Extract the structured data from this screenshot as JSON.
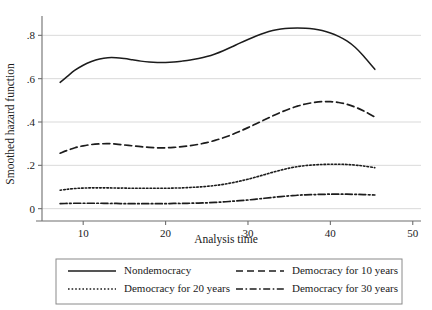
{
  "chart_data": {
    "type": "line",
    "title": "",
    "xlabel": "Analysis time",
    "ylabel": "Smoothed hazard function",
    "xlim": [
      5,
      51
    ],
    "ylim": [
      -0.02,
      0.88
    ],
    "xticks": [
      "10",
      "20",
      "30",
      "40",
      "50"
    ],
    "xtick_values": [
      10,
      20,
      30,
      40,
      50
    ],
    "yticks": [
      "0",
      ".2",
      ".4",
      ".6",
      ".8"
    ],
    "ytick_values": [
      0,
      0.2,
      0.4,
      0.6,
      0.8
    ],
    "grid": "horizontal",
    "legend_position": "below-plot",
    "line_color": "#1c1c1c",
    "grid_color": "#cfcfcf",
    "axis_color": "#6e6e6e",
    "series": [
      {
        "name": "Nondemocracy",
        "dash": "solid",
        "x": [
          7.2,
          8,
          9,
          10,
          11,
          12,
          13,
          14,
          15,
          16,
          17,
          18,
          19,
          20,
          21,
          22,
          23,
          24,
          25,
          26,
          27,
          28,
          29,
          30,
          31,
          32,
          33,
          34,
          35,
          36,
          37,
          38,
          39,
          40,
          41,
          42,
          43,
          44,
          45.4
        ],
        "values": [
          0.583,
          0.608,
          0.639,
          0.662,
          0.679,
          0.691,
          0.697,
          0.697,
          0.693,
          0.687,
          0.681,
          0.677,
          0.675,
          0.675,
          0.677,
          0.681,
          0.686,
          0.693,
          0.702,
          0.714,
          0.729,
          0.746,
          0.764,
          0.781,
          0.797,
          0.811,
          0.822,
          0.829,
          0.833,
          0.834,
          0.833,
          0.829,
          0.822,
          0.811,
          0.795,
          0.774,
          0.745,
          0.706,
          0.643
        ]
      },
      {
        "name": "Democracy for 10 years",
        "dash": "dashed",
        "x": [
          7.2,
          8,
          9,
          10,
          11,
          12,
          13,
          14,
          15,
          16,
          17,
          18,
          19,
          20,
          21,
          22,
          23,
          24,
          25,
          26,
          27,
          28,
          29,
          30,
          31,
          32,
          33,
          34,
          35,
          36,
          37,
          38,
          39,
          40,
          41,
          42,
          43,
          44,
          45.4
        ],
        "values": [
          0.256,
          0.268,
          0.281,
          0.29,
          0.296,
          0.299,
          0.3,
          0.298,
          0.294,
          0.29,
          0.286,
          0.283,
          0.281,
          0.281,
          0.283,
          0.286,
          0.291,
          0.297,
          0.305,
          0.315,
          0.327,
          0.341,
          0.357,
          0.374,
          0.392,
          0.41,
          0.428,
          0.445,
          0.46,
          0.473,
          0.483,
          0.49,
          0.494,
          0.494,
          0.49,
          0.482,
          0.469,
          0.452,
          0.423
        ]
      },
      {
        "name": "Democracy for 20 years",
        "dash": "dotted",
        "x": [
          7.2,
          8,
          9,
          10,
          11,
          12,
          13,
          14,
          15,
          16,
          17,
          18,
          19,
          20,
          21,
          22,
          23,
          24,
          25,
          26,
          27,
          28,
          29,
          30,
          31,
          32,
          33,
          34,
          35,
          36,
          37,
          38,
          39,
          40,
          41,
          42,
          43,
          44,
          45.4
        ],
        "values": [
          0.085,
          0.089,
          0.093,
          0.095,
          0.096,
          0.096,
          0.096,
          0.095,
          0.095,
          0.094,
          0.094,
          0.094,
          0.094,
          0.094,
          0.095,
          0.096,
          0.098,
          0.1,
          0.103,
          0.107,
          0.112,
          0.119,
          0.127,
          0.136,
          0.146,
          0.157,
          0.168,
          0.178,
          0.187,
          0.194,
          0.199,
          0.202,
          0.204,
          0.205,
          0.205,
          0.204,
          0.201,
          0.197,
          0.189
        ]
      },
      {
        "name": "Democracy for 30 years",
        "dash": "dash-dot",
        "x": [
          7.2,
          8,
          9,
          10,
          11,
          12,
          13,
          14,
          15,
          16,
          17,
          18,
          19,
          20,
          21,
          22,
          23,
          24,
          25,
          26,
          27,
          28,
          29,
          30,
          31,
          32,
          33,
          34,
          35,
          36,
          37,
          38,
          39,
          40,
          41,
          42,
          43,
          44,
          45.4
        ],
        "values": [
          0.023,
          0.024,
          0.025,
          0.025,
          0.025,
          0.025,
          0.024,
          0.024,
          0.023,
          0.023,
          0.023,
          0.023,
          0.023,
          0.023,
          0.024,
          0.024,
          0.025,
          0.026,
          0.027,
          0.029,
          0.031,
          0.034,
          0.037,
          0.04,
          0.044,
          0.048,
          0.052,
          0.056,
          0.059,
          0.062,
          0.064,
          0.065,
          0.066,
          0.067,
          0.067,
          0.067,
          0.066,
          0.065,
          0.063
        ]
      }
    ]
  },
  "legend": {
    "items": [
      {
        "label": "Nondemocracy",
        "dash": "solid"
      },
      {
        "label": "Democracy for 10 years",
        "dash": "dashed"
      },
      {
        "label": "Democracy for 20 years",
        "dash": "dotted"
      },
      {
        "label": "Democracy for 30 years",
        "dash": "dash-dot"
      }
    ]
  }
}
